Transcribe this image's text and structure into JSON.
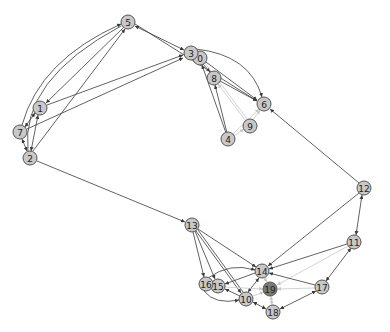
{
  "graph": {
    "type": "directed network",
    "node_fill": "#c8c8c8",
    "node_highlight_fill": "#7a7a7a",
    "edge_color": "#3a3a3a",
    "edge_light_color": "#c8c8c8",
    "nodes": [
      {
        "id": "0",
        "label": "0",
        "x": 200,
        "y": 58
      },
      {
        "id": "1",
        "label": "1",
        "x": 40,
        "y": 108
      },
      {
        "id": "2",
        "label": "2",
        "x": 30,
        "y": 158
      },
      {
        "id": "3",
        "label": "3",
        "x": 191,
        "y": 53
      },
      {
        "id": "4",
        "label": "4",
        "x": 228,
        "y": 139
      },
      {
        "id": "5",
        "label": "5",
        "x": 128,
        "y": 22
      },
      {
        "id": "6",
        "label": "6",
        "x": 264,
        "y": 104
      },
      {
        "id": "7",
        "label": "7",
        "x": 20,
        "y": 132
      },
      {
        "id": "8",
        "label": "8",
        "x": 214,
        "y": 78
      },
      {
        "id": "9",
        "label": "9",
        "x": 250,
        "y": 126
      },
      {
        "id": "10",
        "label": "10",
        "x": 246,
        "y": 299
      },
      {
        "id": "11",
        "label": "11",
        "x": 354,
        "y": 242
      },
      {
        "id": "12",
        "label": "12",
        "x": 364,
        "y": 188
      },
      {
        "id": "13",
        "label": "13",
        "x": 192,
        "y": 225
      },
      {
        "id": "14",
        "label": "14",
        "x": 262,
        "y": 271
      },
      {
        "id": "15",
        "label": "15",
        "x": 218,
        "y": 286
      },
      {
        "id": "16",
        "label": "16",
        "x": 206,
        "y": 284
      },
      {
        "id": "17",
        "label": "17",
        "x": 322,
        "y": 287
      },
      {
        "id": "18",
        "label": "18",
        "x": 273,
        "y": 312
      },
      {
        "id": "19",
        "label": "19",
        "x": 270,
        "y": 289,
        "highlight": true
      }
    ]
  }
}
